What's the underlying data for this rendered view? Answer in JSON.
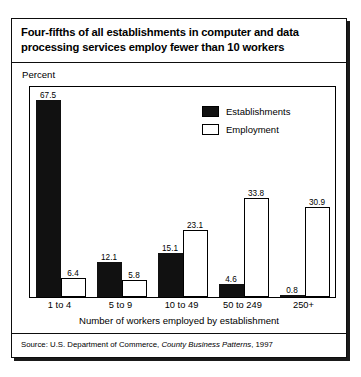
{
  "figure": {
    "title": "Four-fifths of all establishments in computer and data processing services employ fewer than 10 workers",
    "percent_label": "Percent",
    "source_prefix": "Source: U.S. Department of Commerce, ",
    "source_italic": "County Business Patterns",
    "source_suffix": ", 1997"
  },
  "colors": {
    "establishments": "#111111",
    "employment": "#ffffff",
    "outline": "#000000",
    "frame": "#0d0d0d",
    "background": "#ffffff"
  },
  "chart_data": {
    "type": "bar",
    "title": "Four-fifths of all establishments in computer and data processing services employ fewer than 10 workers",
    "xlabel": "Number of workers employed by establishment",
    "ylabel": "Percent",
    "ylim": [
      0,
      72
    ],
    "grid": false,
    "legend_position": "upper-right",
    "categories": [
      "1 to 4",
      "5 to 9",
      "10 to 49",
      "50 to 249",
      "250+"
    ],
    "series": [
      {
        "name": "Establishments",
        "fill": "#111111",
        "values": [
          67.5,
          12.1,
          15.1,
          4.6,
          0.8
        ],
        "labels": [
          "67.5",
          "12.1",
          "15.1",
          "4.6",
          "0.8"
        ]
      },
      {
        "name": "Employment",
        "fill": "#ffffff",
        "values": [
          6.4,
          5.8,
          23.1,
          33.8,
          30.9
        ],
        "labels": [
          "6.4",
          "5.8",
          "23.1",
          "33.8",
          "30.9"
        ]
      }
    ]
  }
}
